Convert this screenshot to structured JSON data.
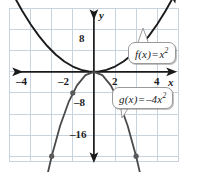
{
  "chart_data": {
    "type": "line",
    "title": "",
    "xlabel": "x",
    "ylabel": "y",
    "grid": true,
    "legend": "annotations",
    "xlim": [
      -5,
      4
    ],
    "ylim": [
      -22,
      14
    ],
    "xticks": [
      -4,
      -2,
      2,
      4
    ],
    "yticks": [
      8,
      -8,
      -16
    ],
    "xtick_labels": [
      "–4",
      "–2",
      "2",
      "4"
    ],
    "ytick_labels": [
      "8",
      "–8",
      "–16"
    ],
    "series": [
      {
        "name": "f",
        "label": "f(x) = x²",
        "equation_lhs": "f(x)",
        "equation_op": "=",
        "equation_rhs_base": "x",
        "equation_rhs_exp": "2",
        "color": "#1a1a1a",
        "x": [
          -3.8,
          -3.4,
          -3.0,
          -2.6,
          -2.2,
          -1.8,
          -1.4,
          -1.0,
          -0.6,
          -0.2,
          0.2,
          0.6,
          1.0,
          1.4,
          1.8,
          2.2,
          2.6,
          3.0,
          3.4,
          3.8
        ],
        "y": [
          14.44,
          11.56,
          9.0,
          6.76,
          4.84,
          3.24,
          1.96,
          1.0,
          0.36,
          0.04,
          0.04,
          0.36,
          1.0,
          1.96,
          3.24,
          4.84,
          6.76,
          9.0,
          11.56,
          14.44
        ],
        "arrows": "both",
        "points": []
      },
      {
        "name": "g",
        "label": "g(x) = –4x²",
        "equation_lhs": "g(x)",
        "equation_op": "=",
        "equation_rhs_coef": "–4x",
        "equation_rhs_exp": "2",
        "color": "#4a4a4a",
        "x": [
          -2.3,
          -2.0,
          -1.6,
          -1.2,
          -0.8,
          -0.4,
          0,
          0.4,
          0.8,
          1.2,
          1.6,
          2.0,
          2.3
        ],
        "y": [
          -21.16,
          -16.0,
          -10.24,
          -5.76,
          -2.56,
          -0.64,
          0,
          -0.64,
          -2.56,
          -5.76,
          -10.24,
          -16.0,
          -21.16
        ],
        "arrows": "both",
        "points": [
          {
            "x": -2,
            "y": -16
          },
          {
            "x": -1,
            "y": -4
          },
          {
            "x": 1,
            "y": -4
          },
          {
            "x": 2,
            "y": -16
          }
        ]
      }
    ],
    "colors": {
      "grid": "#c9d3dd",
      "axis": "#1a1a1a",
      "curve_f": "#1a1a1a",
      "curve_g": "#4a4a4a",
      "callout_border": "#9a9a9a",
      "callout_bg": "#ffffff",
      "text": "#1d1d1d",
      "background": "#ffffff"
    }
  },
  "axes": {
    "x_axis_name": "x",
    "y_axis_name": "y"
  },
  "annotations": {
    "f": {
      "lhs": "f(x)",
      "op": "=",
      "base": "x",
      "exp": "2"
    },
    "g": {
      "lhs": "g(x)",
      "op": "=",
      "base": "–4x",
      "exp": "2"
    }
  },
  "ticks": {
    "x_neg4": "–4",
    "x_neg2": "–2",
    "x_pos2": "2",
    "x_pos4": "4",
    "y_pos8": "8",
    "y_neg8": "–8",
    "y_neg16": "–16"
  }
}
